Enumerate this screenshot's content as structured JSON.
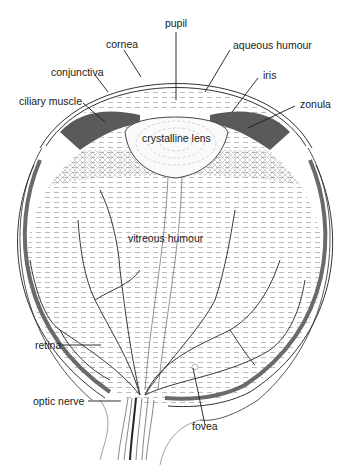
{
  "diagram": {
    "labels": {
      "pupil": "pupil",
      "cornea": "cornea",
      "aqueous_humour": "aqueous humour",
      "conjunctiva": "conjunctiva",
      "iris": "iris",
      "ciliary_muscle": "ciliary muscle",
      "zonula": "zonula",
      "crystalline_lens": "crystalline lens",
      "vitreous_humour": "vitreous humour",
      "retina": "retina",
      "optic_nerve": "optic nerve",
      "fovea": "fovea"
    },
    "colors": {
      "ink": "#1a1a1a",
      "tissue_dark": "#555555",
      "tissue_mid": "#8a8a8a",
      "hatch": "#b8b8b8",
      "background": "#ffffff"
    }
  }
}
